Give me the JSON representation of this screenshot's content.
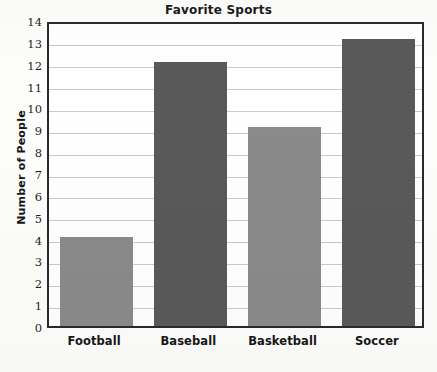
{
  "chart_data": {
    "type": "bar",
    "title": "Favorite Sports",
    "xlabel": "",
    "ylabel": "Number of People",
    "categories": [
      "Football",
      "Baseball",
      "Basketball",
      "Soccer"
    ],
    "values": [
      4.05,
      12.1,
      9.1,
      13.15
    ],
    "ylim": [
      0,
      14
    ],
    "ytick_labels": [
      "0",
      "1",
      "2",
      "3",
      "4",
      "5",
      "6",
      "7",
      "8",
      "9",
      "10",
      "11",
      "12",
      "13",
      "14"
    ],
    "grid": true,
    "legend": "none",
    "bar_colors": [
      "#8a8a8a",
      "#595959",
      "#8a8a8a",
      "#595959"
    ],
    "series": [
      {
        "name": "Number of People",
        "values": [
          4.05,
          12.1,
          9.1,
          13.15
        ]
      }
    ]
  },
  "style": {
    "plot_border_color": "#2a2a2a",
    "gridline_color": "#c9c9c9",
    "plot_background": "#ffffff",
    "page_background": "#fdfdfc",
    "light_bar": "#8a8a8a",
    "dark_bar": "#595959"
  }
}
